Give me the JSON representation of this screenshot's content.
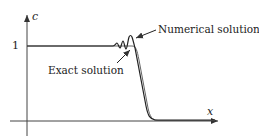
{
  "figure": {
    "y_axis_label": "c",
    "x_axis_label": "x",
    "y_tick_label": "1",
    "annotations": {
      "numerical": "Numerical solution",
      "exact": "Exact solution"
    }
  },
  "colors": {
    "axis": "#333333",
    "exact_curve": "#555555",
    "numerical_curve": "#222222",
    "text": "#222222"
  }
}
